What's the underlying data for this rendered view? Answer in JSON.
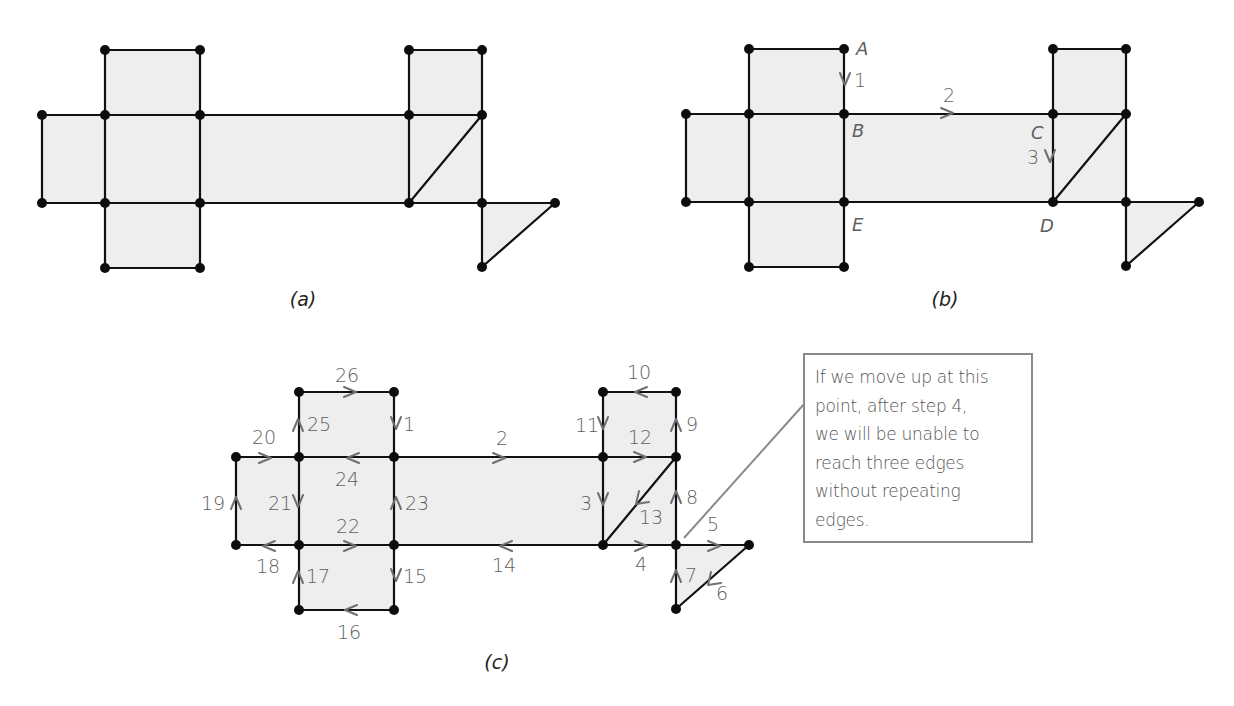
{
  "figure": {
    "panels": [
      {
        "id": "a",
        "caption": "(a)",
        "vertex_labels": [],
        "step_labels": []
      },
      {
        "id": "b",
        "caption": "(b)",
        "vertex_labels": [
          "A",
          "B",
          "C",
          "D",
          "E"
        ],
        "step_labels": [
          "1",
          "2",
          "3"
        ]
      },
      {
        "id": "c",
        "caption": "(c)",
        "vertex_labels": [],
        "step_labels": [
          "1",
          "2",
          "3",
          "4",
          "5",
          "6",
          "7",
          "8",
          "9",
          "10",
          "11",
          "12",
          "13",
          "14",
          "15",
          "16",
          "17",
          "18",
          "19",
          "20",
          "21",
          "22",
          "23",
          "24",
          "25",
          "26"
        ]
      }
    ],
    "panel_b_labels": {
      "A": "A",
      "B": "B",
      "C": "C",
      "D": "D",
      "E": "E",
      "s1": "1",
      "s2": "2",
      "s3": "3"
    },
    "panel_c_steps": {
      "s1": "1",
      "s2": "2",
      "s3": "3",
      "s4": "4",
      "s5": "5",
      "s6": "6",
      "s7": "7",
      "s8": "8",
      "s9": "9",
      "s10": "10",
      "s11": "11",
      "s12": "12",
      "s13": "13",
      "s14": "14",
      "s15": "15",
      "s16": "16",
      "s17": "17",
      "s18": "18",
      "s19": "19",
      "s20": "20",
      "s21": "21",
      "s22": "22",
      "s23": "23",
      "s24": "24",
      "s25": "25",
      "s26": "26"
    },
    "callout": {
      "lines": [
        "If we move up at this",
        "point, after step 4,",
        "we will be unable to",
        "reach three edges",
        "without repeating",
        "edges."
      ]
    },
    "colors": {
      "face_fill": "#eeeeee",
      "edge": "#111111",
      "arrow": "#6f6f6f",
      "callout_border": "#8a8a8a"
    }
  }
}
